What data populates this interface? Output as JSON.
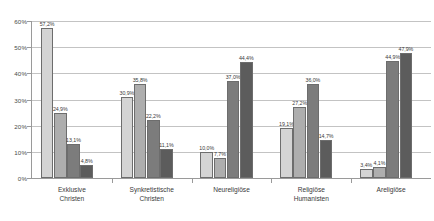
{
  "chart_data": {
    "type": "bar",
    "title": "",
    "subtitle": "",
    "xlabel": "",
    "ylabel": "",
    "ylim": [
      0,
      60
    ],
    "ytick_labels": [
      "0%",
      "10%",
      "20%",
      "30%",
      "40%",
      "50%",
      "60%"
    ],
    "ytick_values": [
      0,
      10,
      20,
      30,
      40,
      50,
      60
    ],
    "grid": true,
    "legend": "none",
    "value_label_suffix": "%",
    "categories": [
      "Exklusive\nChristen",
      "Synkretistische\nChristen",
      "Neureligiöse",
      "Religiöse\nHumanisten",
      "Areligiöse"
    ],
    "series": [
      {
        "name": "Serie 1",
        "color": "#d4d4d4",
        "values": [
          57.2,
          30.9,
          10.0,
          19.1,
          3.4
        ],
        "labels": [
          "57,2%",
          "30,9%",
          "10,0%",
          "19,1%",
          "3,4%"
        ]
      },
      {
        "name": "Serie 2",
        "color": "#aeaeae",
        "values": [
          24.9,
          35.8,
          7.7,
          27.2,
          4.1
        ],
        "labels": [
          "24,9%",
          "35,8%",
          "7,7%",
          "27,2%",
          "4,1%"
        ]
      },
      {
        "name": "Serie 3",
        "color": "#7c7c7c",
        "values": [
          13.1,
          22.2,
          37.0,
          36.0,
          44.9
        ],
        "labels": [
          "13,1%",
          "22,2%",
          "37,0%",
          "36,0%",
          "44,9%"
        ]
      },
      {
        "name": "Serie 4",
        "color": "#5c5c5c",
        "values": [
          4.8,
          11.1,
          44.4,
          14.7,
          47.9
        ],
        "labels": [
          "4,8%",
          "11,1%",
          "44,4%",
          "14,7%",
          "47,9%"
        ]
      }
    ]
  }
}
